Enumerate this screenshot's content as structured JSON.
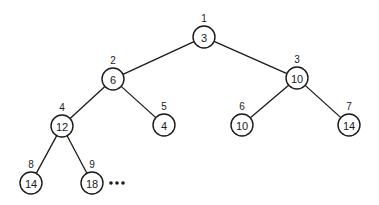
{
  "diagram": {
    "type": "binary-heap-tree",
    "node_radius": 11,
    "nodes": [
      {
        "index": "1",
        "value": "3",
        "x": 204,
        "y": 37
      },
      {
        "index": "2",
        "value": "6",
        "x": 113,
        "y": 79
      },
      {
        "index": "3",
        "value": "10",
        "x": 297,
        "y": 78
      },
      {
        "index": "4",
        "value": "12",
        "x": 62,
        "y": 126
      },
      {
        "index": "5",
        "value": "4",
        "x": 164,
        "y": 125
      },
      {
        "index": "6",
        "value": "10",
        "x": 242,
        "y": 125
      },
      {
        "index": "7",
        "value": "14",
        "x": 349,
        "y": 125
      },
      {
        "index": "8",
        "value": "14",
        "x": 31,
        "y": 183
      },
      {
        "index": "9",
        "value": "18",
        "x": 92,
        "y": 183
      }
    ],
    "edges": [
      [
        "1",
        "2"
      ],
      [
        "1",
        "3"
      ],
      [
        "2",
        "4"
      ],
      [
        "2",
        "5"
      ],
      [
        "3",
        "6"
      ],
      [
        "3",
        "7"
      ],
      [
        "4",
        "8"
      ],
      [
        "4",
        "9"
      ]
    ],
    "continuation": "•••"
  }
}
